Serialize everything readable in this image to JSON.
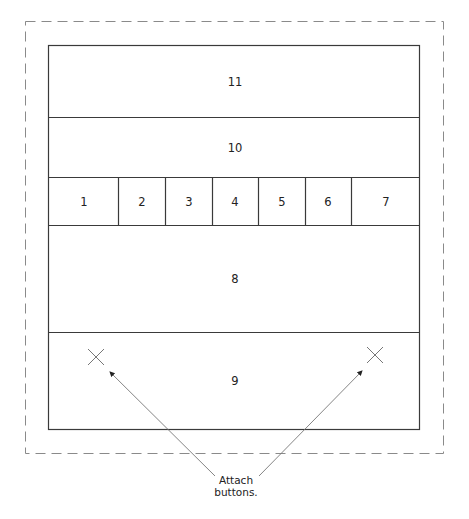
{
  "diagram": {
    "sections": [
      {
        "id": "section-11",
        "label": "11"
      },
      {
        "id": "section-10",
        "label": "10"
      },
      {
        "id": "section-8",
        "label": "8"
      },
      {
        "id": "section-9",
        "label": "9"
      }
    ],
    "row_cells": [
      "1",
      "2",
      "3",
      "4",
      "5",
      "6",
      "7"
    ],
    "annotation": {
      "line1": "Attach",
      "line2": "buttons."
    },
    "colors": {
      "stroke": "#3a3a3a",
      "dashed": "#8a8a8a",
      "marker": "#777777"
    }
  }
}
